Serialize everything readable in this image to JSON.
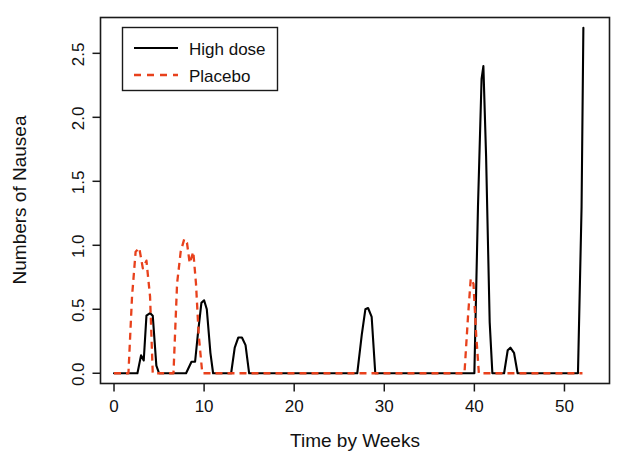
{
  "chart_data": {
    "type": "line",
    "title": "",
    "xlabel": "Time by Weeks",
    "ylabel": "Numbers of Nausea",
    "xlim": [
      -1.5,
      55
    ],
    "ylim": [
      -0.08,
      2.78
    ],
    "grid": false,
    "legend_position": "top-left",
    "xticks": [
      0,
      10,
      20,
      30,
      40,
      50
    ],
    "xtick_labels": [
      "0",
      "10",
      "20",
      "30",
      "40",
      "50"
    ],
    "yticks": [
      0.0,
      0.5,
      1.0,
      1.5,
      2.0,
      2.5
    ],
    "ytick_labels": [
      "0.0",
      "0.5",
      "1.0",
      "1.5",
      "2.0",
      "2.5"
    ],
    "series": [
      {
        "name": "High dose",
        "color": "#000000",
        "style": "solid",
        "points": [
          [
            0.0,
            0.0
          ],
          [
            2.0,
            0.0
          ],
          [
            2.6,
            0.0
          ],
          [
            3.0,
            0.14
          ],
          [
            3.3,
            0.1
          ],
          [
            3.6,
            0.45
          ],
          [
            4.0,
            0.47
          ],
          [
            4.3,
            0.45
          ],
          [
            4.7,
            0.06
          ],
          [
            5.0,
            0.0
          ],
          [
            6.5,
            0.0
          ],
          [
            8.0,
            0.0
          ],
          [
            8.6,
            0.09
          ],
          [
            9.0,
            0.09
          ],
          [
            9.3,
            0.3
          ],
          [
            9.7,
            0.55
          ],
          [
            10.0,
            0.57
          ],
          [
            10.3,
            0.5
          ],
          [
            10.7,
            0.16
          ],
          [
            11.0,
            0.0
          ],
          [
            13.0,
            0.0
          ],
          [
            13.4,
            0.2
          ],
          [
            13.8,
            0.28
          ],
          [
            14.2,
            0.28
          ],
          [
            14.6,
            0.22
          ],
          [
            15.0,
            0.0
          ],
          [
            17.0,
            0.0
          ],
          [
            27.0,
            0.0
          ],
          [
            27.5,
            0.3
          ],
          [
            27.9,
            0.5
          ],
          [
            28.2,
            0.51
          ],
          [
            28.6,
            0.44
          ],
          [
            29.0,
            0.0
          ],
          [
            33.0,
            0.0
          ],
          [
            39.5,
            0.0
          ],
          [
            40.0,
            0.0
          ],
          [
            40.4,
            1.3
          ],
          [
            40.8,
            2.3
          ],
          [
            41.0,
            2.4
          ],
          [
            41.3,
            1.7
          ],
          [
            41.7,
            0.4
          ],
          [
            42.0,
            0.0
          ],
          [
            43.3,
            0.0
          ],
          [
            43.7,
            0.18
          ],
          [
            44.0,
            0.2
          ],
          [
            44.4,
            0.16
          ],
          [
            44.8,
            0.0
          ],
          [
            47.0,
            0.0
          ],
          [
            51.5,
            0.0
          ],
          [
            51.9,
            1.3
          ],
          [
            52.1,
            2.7
          ]
        ]
      },
      {
        "name": "Placebo",
        "color": "#E8411C",
        "style": "dashed",
        "points": [
          [
            0.0,
            0.0
          ],
          [
            1.6,
            0.0
          ],
          [
            2.0,
            0.6
          ],
          [
            2.4,
            0.95
          ],
          [
            2.8,
            0.98
          ],
          [
            3.2,
            0.82
          ],
          [
            3.6,
            0.88
          ],
          [
            4.0,
            0.6
          ],
          [
            4.3,
            0.0
          ],
          [
            6.0,
            0.0
          ],
          [
            6.6,
            0.0
          ],
          [
            7.0,
            0.7
          ],
          [
            7.4,
            0.95
          ],
          [
            7.8,
            1.05
          ],
          [
            8.1,
            1.02
          ],
          [
            8.4,
            0.86
          ],
          [
            8.8,
            0.95
          ],
          [
            9.1,
            0.7
          ],
          [
            9.4,
            0.3
          ],
          [
            9.8,
            0.0
          ],
          [
            12.0,
            0.0
          ],
          [
            20.0,
            0.0
          ],
          [
            30.0,
            0.0
          ],
          [
            38.9,
            0.0
          ],
          [
            39.3,
            0.45
          ],
          [
            39.6,
            0.74
          ],
          [
            39.9,
            0.7
          ],
          [
            40.2,
            0.3
          ],
          [
            40.5,
            0.0
          ],
          [
            45.0,
            0.0
          ],
          [
            52.0,
            0.0
          ]
        ]
      }
    ]
  },
  "legend": {
    "entries": [
      {
        "label": "High dose",
        "style": "solid",
        "color": "#000000"
      },
      {
        "label": "Placebo",
        "style": "dashed",
        "color": "#E8411C"
      }
    ]
  },
  "colors": {
    "high_dose": "#000000",
    "placebo": "#E8411C",
    "axis": "#1a1a1a",
    "background": "#ffffff"
  }
}
